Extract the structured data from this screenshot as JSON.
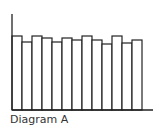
{
  "caption": "Diagram A",
  "chart_data": {
    "type": "bar",
    "title": "",
    "caption": "Diagram A",
    "xlabel": "",
    "ylabel": "",
    "categories": [
      "1",
      "2",
      "3",
      "4",
      "5",
      "6",
      "7",
      "8",
      "9",
      "10",
      "11",
      "12",
      "13"
    ],
    "values": [
      74,
      68,
      74,
      72,
      68,
      72,
      70,
      74,
      70,
      66,
      74,
      67,
      70
    ],
    "ylim": [
      0,
      96
    ],
    "grid": false,
    "legend": null,
    "style": {
      "fill": "#ffffff",
      "stroke": "#222222"
    }
  },
  "layout": {
    "axis_left_x": 12,
    "axis_top_y": 14,
    "baseline_y": 110,
    "axis_right_x": 153,
    "bar_start_x": 12,
    "bar_width": 10
  }
}
